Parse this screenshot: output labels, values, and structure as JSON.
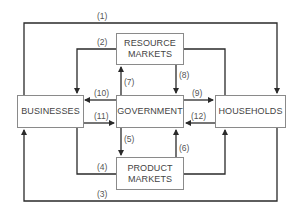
{
  "diagram": {
    "type": "circular-flow",
    "nodes": {
      "resource_markets": "RESOURCE\nMARKETS",
      "resource_markets_l1": "RESOURCE",
      "resource_markets_l2": "MARKETS",
      "businesses": "BUSINESSES",
      "government": "GOVERNMENT",
      "households": "HOUSEHOLDS",
      "product_markets_l1": "PRODUCT",
      "product_markets_l2": "MARKETS"
    },
    "flows": [
      {
        "id": "1",
        "label": "(1)",
        "from": "businesses",
        "to": "households"
      },
      {
        "id": "2",
        "label": "(2)",
        "from": "resource_markets",
        "to": "businesses"
      },
      {
        "id": "3",
        "label": "(3)",
        "from": "households",
        "to": "businesses"
      },
      {
        "id": "4",
        "label": "(4)",
        "from": "businesses",
        "to": "product_markets"
      },
      {
        "id": "5",
        "label": "(5)",
        "from": "government",
        "to": "product_markets"
      },
      {
        "id": "6",
        "label": "(6)",
        "from": "product_markets",
        "to": "government"
      },
      {
        "id": "7",
        "label": "(7)",
        "from": "government",
        "to": "resource_markets"
      },
      {
        "id": "8",
        "label": "(8)",
        "from": "resource_markets",
        "to": "government"
      },
      {
        "id": "9",
        "label": "(9)",
        "from": "government",
        "to": "households"
      },
      {
        "id": "10",
        "label": "(10)",
        "from": "government",
        "to": "businesses"
      },
      {
        "id": "11",
        "label": "(11)",
        "from": "businesses",
        "to": "government"
      },
      {
        "id": "12",
        "label": "(12)",
        "from": "households",
        "to": "government"
      }
    ],
    "line_color": "#2a2a2a",
    "box_border_color": "#8a8a8a"
  }
}
